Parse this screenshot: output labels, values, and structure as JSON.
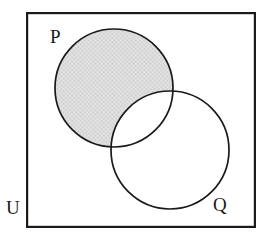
{
  "figure": {
    "type": "venn-diagram",
    "background_color": "#ffffff"
  },
  "labels": {
    "universe": "U",
    "set_p": "P",
    "set_q": "Q"
  },
  "colors": {
    "stroke": "#1a1a1a",
    "shade_fill": "#d9d9d9",
    "shade_dot": "#b5b5b5",
    "white_fill": "#ffffff",
    "label_color": "#1a1a1a"
  },
  "geometry": {
    "canvas": {
      "width": 268,
      "height": 239
    },
    "universe_rect": {
      "x": 26,
      "y": 12,
      "width": 230,
      "height": 216,
      "stroke_width": 2.2
    },
    "circle_p": {
      "cx": 114,
      "cy": 88,
      "r": 59,
      "stroke_width": 1.7
    },
    "circle_q": {
      "cx": 170,
      "cy": 150,
      "r": 59,
      "stroke_width": 1.7
    }
  },
  "shading": {
    "region": "P minus Q",
    "description": "The part of circle P that lies outside circle Q is filled with a light gray halftone dot pattern; the lens-shaped intersection of P and Q is white, as is the remainder of circle Q and the rest of the universal set.",
    "pattern": "halftone-dots",
    "fill": "#d9d9d9"
  },
  "chart_data": {
    "type": "venn",
    "title": "",
    "sets": [
      {
        "name": "P",
        "label": "P",
        "cx": 114,
        "cy": 88,
        "r": 59,
        "shaded": true
      },
      {
        "name": "Q",
        "label": "Q",
        "cx": 170,
        "cy": 150,
        "r": 59,
        "shaded": false
      }
    ],
    "universe": {
      "label": "U",
      "shape": "rectangle",
      "x": 26,
      "y": 12,
      "width": 230,
      "height": 216
    },
    "regions": [
      {
        "id": "P-only",
        "expression": "P \\ Q",
        "shaded": true,
        "fill": "#d9d9d9"
      },
      {
        "id": "P-and-Q",
        "expression": "P ∩ Q",
        "shaded": false,
        "fill": "#ffffff"
      },
      {
        "id": "Q-only",
        "expression": "Q \\ P",
        "shaded": false,
        "fill": "#ffffff"
      },
      {
        "id": "outside",
        "expression": "U \\ (P ∪ Q)",
        "shaded": false,
        "fill": "#ffffff"
      }
    ],
    "legend": "none",
    "grid": false
  }
}
